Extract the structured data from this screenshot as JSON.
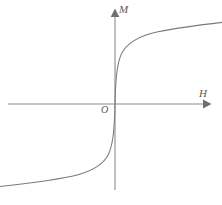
{
  "figure": {
    "name": "magnetization-curve",
    "width": 222,
    "height": 205,
    "background_color": "#ffffff",
    "line_color": "#7a7a7a",
    "axis_color": "#8c8c8c",
    "label_color": "#5a5a5a"
  },
  "labels": {
    "vertical_axis": "M",
    "horizontal_axis": "H",
    "origin": "O"
  },
  "chart_data": {
    "type": "line",
    "title": "",
    "xlabel": "H",
    "ylabel": "M",
    "grid": false,
    "legend": null,
    "axis_arrows": {
      "x_positive": true,
      "y_positive": true
    },
    "origin_pixel": {
      "x": 115,
      "y": 104
    },
    "axis_extent_pixels": {
      "x_start": 8,
      "x_end": 210,
      "y_top": 10,
      "y_bottom": 190
    },
    "xlim": [
      -1.07,
      1.05
    ],
    "ylim": [
      -1.05,
      1.05
    ],
    "series": [
      {
        "name": "M(H)",
        "x": [
          -1.07,
          -0.95,
          -0.85,
          -0.75,
          -0.65,
          -0.55,
          -0.45,
          -0.38,
          -0.3,
          -0.24,
          -0.18,
          -0.13,
          -0.09,
          -0.06,
          -0.035,
          -0.018,
          -0.008,
          0.0,
          0.008,
          0.018,
          0.035,
          0.06,
          0.09,
          0.13,
          0.18,
          0.24,
          0.3,
          0.38,
          0.45,
          0.55,
          0.65,
          0.75,
          0.85,
          0.95,
          1.05
        ],
        "y": [
          -0.9,
          -0.885,
          -0.875,
          -0.862,
          -0.848,
          -0.832,
          -0.812,
          -0.795,
          -0.772,
          -0.748,
          -0.715,
          -0.672,
          -0.612,
          -0.525,
          -0.4,
          -0.245,
          -0.12,
          0.0,
          0.12,
          0.245,
          0.4,
          0.525,
          0.612,
          0.672,
          0.715,
          0.748,
          0.772,
          0.795,
          0.812,
          0.832,
          0.848,
          0.862,
          0.875,
          0.885,
          0.9
        ]
      }
    ],
    "curve_path": "M 0,186.5 C 20,184.3 48,181.0 72,176.2 C 90,172.3 101,166.0 107,157.0 C 111.5,150.0 113.3,139.0 114.2,124.0 C 114.8,113.5 115,108.0 115,104 C 115,99.9 115.2,94.5 115.8,84.0 C 116.7,69.0 118.5,58.0 123,51.0 C 129,42.0 140,35.7 158,31.8 C 182,27.0 210,23.7 230,21.5"
  }
}
